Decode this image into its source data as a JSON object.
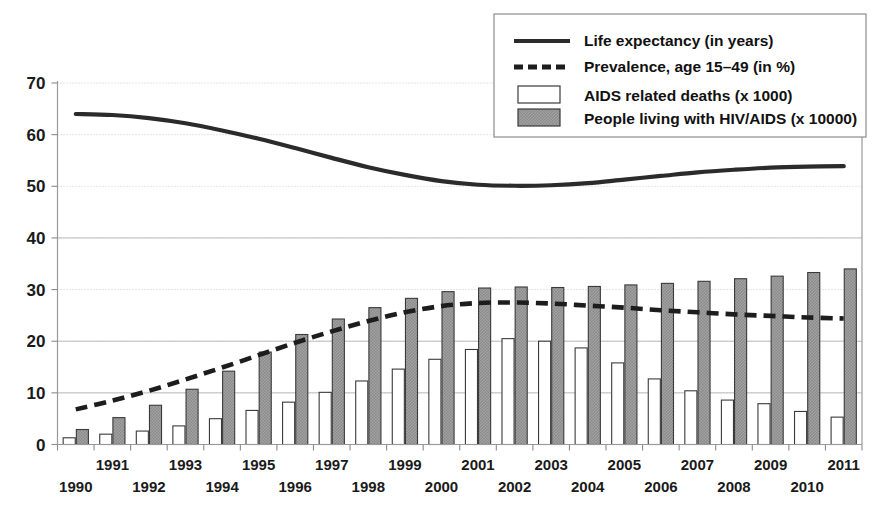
{
  "chart_data": {
    "type": "bar",
    "title": "",
    "subtitle": "",
    "xlabel": "",
    "ylabel": "",
    "ylim": [
      0,
      70
    ],
    "yticks": [
      0,
      10,
      20,
      30,
      40,
      50,
      60,
      70
    ],
    "grid": true,
    "legend_position": "top-right",
    "categories": [
      "1990",
      "1991",
      "1992",
      "1993",
      "1994",
      "1995",
      "1996",
      "1997",
      "1998",
      "1999",
      "2000",
      "2001",
      "2002",
      "2003",
      "2004",
      "2005",
      "2006",
      "2007",
      "2008",
      "2009",
      "2010",
      "2011"
    ],
    "series": [
      {
        "name": "Life expectancy (in years)",
        "type": "line",
        "style": "solid",
        "color": "#2b2b2b",
        "values": [
          64.0,
          63.8,
          63.2,
          62.2,
          60.8,
          59.2,
          57.4,
          55.5,
          53.7,
          52.2,
          51.0,
          50.3,
          50.1,
          50.2,
          50.6,
          51.3,
          52.0,
          52.7,
          53.2,
          53.6,
          53.8,
          53.9
        ]
      },
      {
        "name": "Prevalence, age 15-49 (in %)",
        "type": "line",
        "style": "dashed",
        "color": "#1d1d1d",
        "values": [
          6.8,
          8.5,
          10.4,
          12.6,
          14.9,
          17.3,
          19.7,
          21.9,
          23.9,
          25.6,
          26.8,
          27.4,
          27.5,
          27.3,
          26.9,
          26.5,
          26.0,
          25.6,
          25.2,
          24.9,
          24.6,
          24.4
        ]
      },
      {
        "name": "AIDS related deaths (x 1000)",
        "type": "bar",
        "fill": "white",
        "color": "#ffffff",
        "values": [
          1.3,
          2.0,
          2.6,
          3.6,
          5.0,
          6.6,
          8.2,
          10.1,
          12.3,
          14.6,
          16.5,
          18.4,
          20.5,
          20.0,
          18.7,
          15.8,
          12.7,
          10.4,
          8.6,
          7.9,
          6.4,
          5.3
        ]
      },
      {
        "name": "People living with HIV/AIDS (x 10000)",
        "type": "bar",
        "fill": "gray-hatch",
        "color": "#9c9c9c",
        "values": [
          2.9,
          5.2,
          7.6,
          10.7,
          14.2,
          17.9,
          21.3,
          24.3,
          26.5,
          28.3,
          29.6,
          30.3,
          30.5,
          30.4,
          30.6,
          30.9,
          31.2,
          31.6,
          32.1,
          32.6,
          33.3,
          34.0
        ]
      }
    ],
    "legend": [
      {
        "label": "Life expectancy (in years)",
        "marker": "solid-line"
      },
      {
        "label": "Prevalence, age 15–49 (in %)",
        "marker": "dashed-line"
      },
      {
        "label": "AIDS related deaths (x 1000)",
        "marker": "white-swatch"
      },
      {
        "label": "People living with HIV/AIDS (x 10000)",
        "marker": "gray-swatch"
      }
    ]
  }
}
